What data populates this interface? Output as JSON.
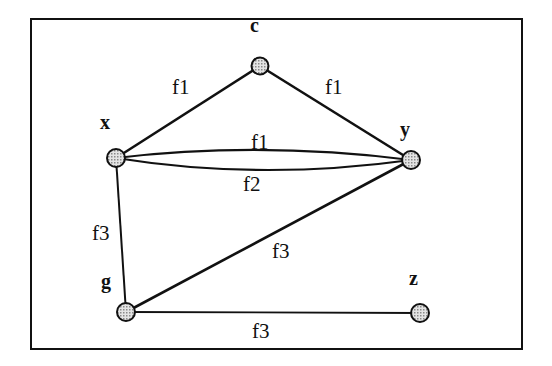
{
  "diagram": {
    "type": "graph",
    "nodes": [
      {
        "id": "c",
        "label": "c",
        "cx": 260,
        "cy": 66,
        "lx": 255,
        "ly": 32
      },
      {
        "id": "x",
        "label": "x",
        "cx": 116,
        "cy": 158,
        "lx": 100,
        "ly": 129
      },
      {
        "id": "y",
        "label": "y",
        "cx": 411,
        "cy": 160,
        "lx": 403,
        "ly": 134
      },
      {
        "id": "g",
        "label": "g",
        "cx": 126,
        "cy": 312,
        "lx": 106,
        "ly": 285
      },
      {
        "id": "z",
        "label": "z",
        "cx": 420,
        "cy": 313,
        "lx": 413,
        "ly": 281
      }
    ],
    "edges": [
      {
        "from": "x",
        "to": "c",
        "label": "f1",
        "lx": 173,
        "ly": 94
      },
      {
        "from": "c",
        "to": "y",
        "label": "f1",
        "lx": 324,
        "ly": 93
      },
      {
        "from": "x",
        "to": "y",
        "label": "f1",
        "lx": 251,
        "ly": 150
      },
      {
        "from": "x",
        "to": "y",
        "label": "f2",
        "lx": 243,
        "ly": 188
      },
      {
        "from": "x",
        "to": "g",
        "label": "f3",
        "lx": 93,
        "ly": 240
      },
      {
        "from": "y",
        "to": "g",
        "label": "f3",
        "lx": 271,
        "ly": 258
      },
      {
        "from": "g",
        "to": "z",
        "label": "f3",
        "lx": 252,
        "ly": 336
      }
    ],
    "colors": {
      "stroke": "#111111",
      "node_fill": "#b8b8b8",
      "background": "#ffffff"
    }
  }
}
